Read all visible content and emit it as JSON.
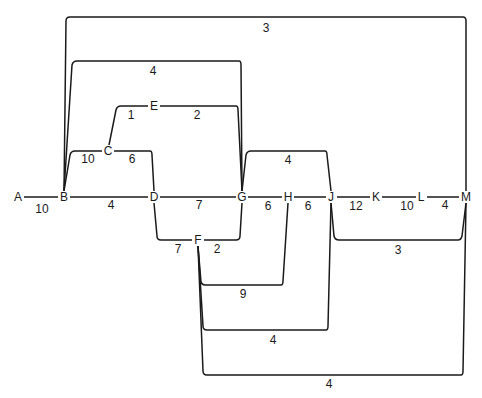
{
  "diagram": {
    "type": "network-graph",
    "nodes": [
      {
        "id": "A",
        "label": "A",
        "x": 18,
        "y": 197
      },
      {
        "id": "B",
        "label": "B",
        "x": 64,
        "y": 197
      },
      {
        "id": "C",
        "label": "C",
        "x": 108,
        "y": 151
      },
      {
        "id": "D",
        "label": "D",
        "x": 154,
        "y": 197
      },
      {
        "id": "E",
        "label": "E",
        "x": 154,
        "y": 106
      },
      {
        "id": "F",
        "label": "F",
        "x": 198,
        "y": 240
      },
      {
        "id": "G",
        "label": "G",
        "x": 242,
        "y": 197
      },
      {
        "id": "H",
        "label": "H",
        "x": 288,
        "y": 197
      },
      {
        "id": "J",
        "label": "J",
        "x": 331,
        "y": 197
      },
      {
        "id": "K",
        "label": "K",
        "x": 376,
        "y": 197
      },
      {
        "id": "L",
        "label": "L",
        "x": 421,
        "y": 197
      },
      {
        "id": "M",
        "label": "M",
        "x": 466,
        "y": 197
      }
    ],
    "edges": [
      {
        "from": "A",
        "to": "B",
        "weight": "10",
        "lx": 42,
        "ly": 209
      },
      {
        "from": "B",
        "to": "D",
        "weight": "4",
        "lx": 111,
        "ly": 205
      },
      {
        "from": "D",
        "to": "G",
        "weight": "7",
        "lx": 199,
        "ly": 205
      },
      {
        "from": "G",
        "to": "H",
        "weight": "6",
        "lx": 268,
        "ly": 206
      },
      {
        "from": "H",
        "to": "J",
        "weight": "6",
        "lx": 308,
        "ly": 206
      },
      {
        "from": "J",
        "to": "K",
        "weight": "12",
        "lx": 356,
        "ly": 206
      },
      {
        "from": "K",
        "to": "L",
        "weight": "10",
        "lx": 407,
        "ly": 206
      },
      {
        "from": "L",
        "to": "M",
        "weight": "4",
        "lx": 445,
        "ly": 205
      },
      {
        "from": "B",
        "to": "C",
        "weight": "10",
        "lx": 88,
        "ly": 159
      },
      {
        "from": "C",
        "to": "D",
        "weight": "6",
        "lx": 132,
        "ly": 159
      },
      {
        "from": "C",
        "to": "E",
        "weight": "1",
        "lx": 131,
        "ly": 115
      },
      {
        "from": "E",
        "to": "G",
        "weight": "2",
        "lx": 197,
        "ly": 115
      },
      {
        "from": "B",
        "to": "G",
        "weight": "4",
        "lx": 153,
        "ly": 71
      },
      {
        "from": "B",
        "to": "M",
        "weight": "3",
        "lx": 266,
        "ly": 28
      },
      {
        "from": "D",
        "to": "F",
        "weight": "7",
        "lx": 178,
        "ly": 249
      },
      {
        "from": "F",
        "to": "G",
        "weight": "2",
        "lx": 217,
        "ly": 249
      },
      {
        "from": "G",
        "to": "J",
        "weight": "4",
        "lx": 288,
        "ly": 160
      },
      {
        "from": "F",
        "to": "H",
        "weight": "9",
        "lx": 243,
        "ly": 294
      },
      {
        "from": "F",
        "to": "J",
        "weight": "4",
        "lx": 273,
        "ly": 340
      },
      {
        "from": "F",
        "to": "M",
        "weight": "4",
        "lx": 329,
        "ly": 384
      },
      {
        "from": "J",
        "to": "M",
        "weight": "3",
        "lx": 398,
        "ly": 250
      }
    ]
  }
}
